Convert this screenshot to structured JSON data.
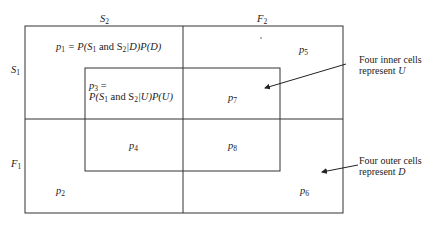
{
  "axes": {
    "top_left": {
      "sym": "S",
      "sub": "2"
    },
    "top_right": {
      "sym": "F",
      "sub": "2"
    },
    "left_top": {
      "sym": "S",
      "sub": "1"
    },
    "left_bottom": {
      "sym": "F",
      "sub": "1"
    }
  },
  "cells": {
    "p1": {
      "sym": "p",
      "sub": "1",
      "formula_prefix": " = P(S",
      "formula_sub1": "1",
      "formula_mid": " and S",
      "formula_sub2": "2",
      "formula_suffix": "|D)P(D)"
    },
    "p2": {
      "sym": "p",
      "sub": "2"
    },
    "p3": {
      "sym": "p",
      "sub": "3",
      "eq": " =",
      "formula_prefix": "P(S",
      "formula_sub1": "1",
      "formula_mid": " and S",
      "formula_sub2": "2",
      "formula_suffix": "|U)P(U)"
    },
    "p4": {
      "sym": "p",
      "sub": "4"
    },
    "p5": {
      "sym": "p",
      "sub": "5"
    },
    "p6": {
      "sym": "p",
      "sub": "6"
    },
    "p7": {
      "sym": "p",
      "sub": "7"
    },
    "p8": {
      "sym": "p",
      "sub": "8"
    }
  },
  "annotations": {
    "inner": {
      "line1": "Four inner cells",
      "line2_prefix": "represent ",
      "line2_var": "U"
    },
    "outer": {
      "line1": "Four outer cells",
      "line2_prefix": "represent ",
      "line2_var": "D"
    }
  }
}
